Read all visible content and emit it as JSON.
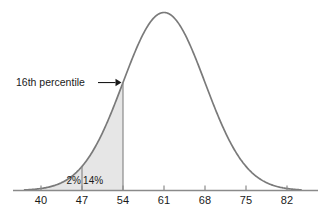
{
  "figure": {
    "background_color": "#ffffff",
    "curve_color": "#7a7a7a",
    "fill_color": "#e6e6e6",
    "axis_color": "#808080",
    "text_color": "#1a1a1a"
  },
  "annotations": {
    "callout": {
      "text": "16th percentile",
      "points_to_value": 54,
      "arrow_icon": "arrow-right-icon"
    },
    "region_labels": [
      {
        "text": "2%",
        "from": 47,
        "to": 54,
        "center_value": 45.6
      },
      {
        "text": "14%",
        "from": 47,
        "to": 54,
        "center_value": 48.9
      }
    ]
  },
  "chart_data": {
    "type": "area",
    "title": "",
    "subtitle": "",
    "xlabel": "",
    "ylabel": "",
    "grid": false,
    "legend": null,
    "distribution": "normal",
    "mean": 61,
    "std_dev": 7,
    "xlim": [
      37.2,
      84.4
    ],
    "ylim": [
      0,
      1
    ],
    "x_ticks": [
      40,
      47,
      54,
      61,
      68,
      75,
      82
    ],
    "x_tick_labels": [
      "40",
      "47",
      "54",
      "61",
      "68",
      "75",
      "82"
    ],
    "shaded_region": {
      "from": null,
      "to": 54,
      "description": "left tail up to 54",
      "fill": "#e6e6e6",
      "percent_total": 16
    },
    "divider_lines": [
      47,
      54
    ],
    "segment_percentages": [
      {
        "label": "2%",
        "range": [
          40,
          47
        ],
        "value": 2
      },
      {
        "label": "14%",
        "range": [
          47,
          54
        ],
        "value": 14
      }
    ],
    "annotation_text": "16th percentile",
    "curve_points": [
      {
        "x": 37.2,
        "y": 0.001
      },
      {
        "x": 40.0,
        "y": 0.006
      },
      {
        "x": 43.0,
        "y": 0.017
      },
      {
        "x": 47.0,
        "y": 0.048
      },
      {
        "x": 50.0,
        "y": 0.095
      },
      {
        "x": 54.0,
        "y": 0.215
      },
      {
        "x": 57.0,
        "y": 0.383
      },
      {
        "x": 61.0,
        "y": 1.0
      },
      {
        "x": 65.0,
        "y": 0.383
      },
      {
        "x": 68.0,
        "y": 0.215
      },
      {
        "x": 72.0,
        "y": 0.095
      },
      {
        "x": 75.0,
        "y": 0.048
      },
      {
        "x": 79.0,
        "y": 0.017
      },
      {
        "x": 82.0,
        "y": 0.006
      },
      {
        "x": 84.4,
        "y": 0.001
      }
    ]
  }
}
